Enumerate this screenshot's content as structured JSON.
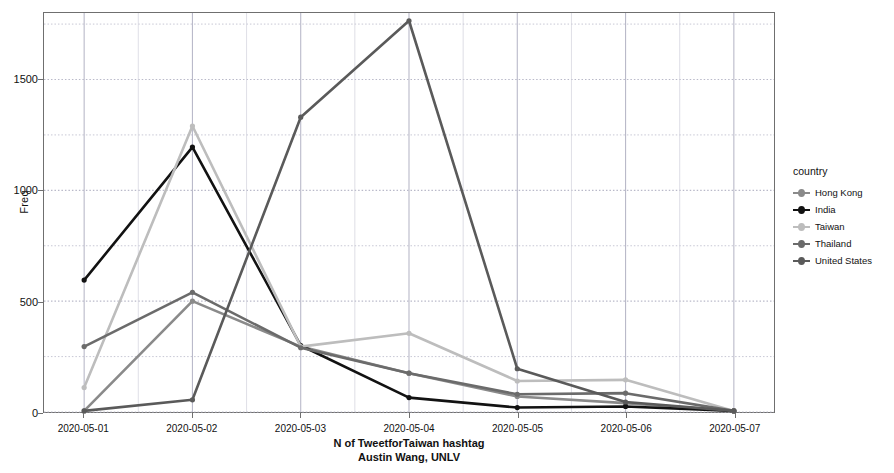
{
  "chart_data": {
    "type": "line",
    "title": "",
    "subtitle": "",
    "xlabel": "N of TweetforTaiwan hashtag",
    "xlabel_line2": "Austin Wang, UNLV",
    "ylabel": "Freq",
    "legend_title": "country",
    "legend_position": "right",
    "grid": true,
    "x": [
      "2020-05-01",
      "2020-05-02",
      "2020-05-03",
      "2020-05-04",
      "2020-05-05",
      "2020-05-06",
      "2020-05-07"
    ],
    "ylim": [
      0,
      1800
    ],
    "yticks_major": [
      0,
      500,
      1000,
      1500
    ],
    "yticks_minor": [
      250,
      750,
      1250,
      1750
    ],
    "series": [
      {
        "name": "Hong Kong",
        "color": "#8a8a8a",
        "values": [
          5,
          500,
          295,
          175,
          70,
          40,
          5
        ]
      },
      {
        "name": "India",
        "color": "#121212",
        "values": [
          595,
          1195,
          300,
          65,
          20,
          25,
          5
        ]
      },
      {
        "name": "Taiwan",
        "color": "#bdbdbd",
        "values": [
          110,
          1290,
          295,
          355,
          140,
          145,
          5
        ]
      },
      {
        "name": "Thailand",
        "color": "#6b6b6b",
        "values": [
          295,
          540,
          290,
          175,
          80,
          85,
          5
        ]
      },
      {
        "name": "United States",
        "color": "#5a5a5a",
        "values": [
          5,
          55,
          1330,
          1765,
          195,
          45,
          5
        ]
      }
    ]
  },
  "axes": {
    "y_title": "Freq",
    "y_tick_labels": [
      "0",
      "500",
      "1000",
      "1500"
    ],
    "x_tick_labels": [
      "2020-05-01",
      "2020-05-02",
      "2020-05-03",
      "2020-05-04",
      "2020-05-05",
      "2020-05-06",
      "2020-05-07"
    ]
  },
  "caption": {
    "line1": "N of TweetforTaiwan hashtag",
    "line2": "Austin Wang, UNLV"
  },
  "legend": {
    "title": "country",
    "items": [
      {
        "label": "Hong Kong",
        "color": "#8a8a8a"
      },
      {
        "label": "India",
        "color": "#121212"
      },
      {
        "label": "Taiwan",
        "color": "#bdbdbd"
      },
      {
        "label": "Thailand",
        "color": "#6b6b6b"
      },
      {
        "label": "United States",
        "color": "#5a5a5a"
      }
    ]
  }
}
